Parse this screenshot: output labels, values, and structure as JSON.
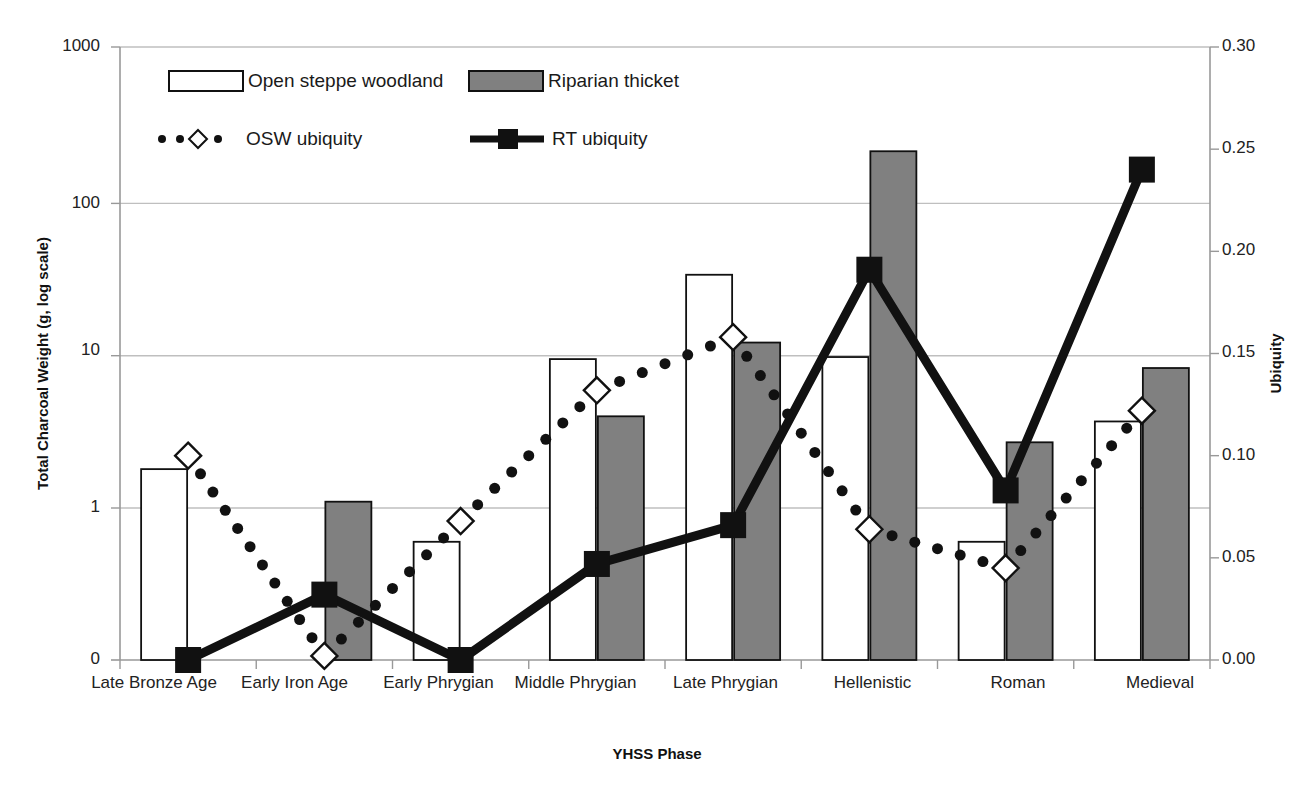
{
  "chart_data": {
    "type": "bar",
    "title": "",
    "xlabel": "YHSS Phase",
    "ylabel": "Total Charcoal Weight (g, log scale)",
    "y2label": "Ubiquity",
    "grid": true,
    "legend_position": "top-left inside plot",
    "categories": [
      "Late Bronze Age",
      "Early Iron Age",
      "Early Phrygian",
      "Middle Phrygian",
      "Late Phrygian",
      "Hellenistic",
      "Roman",
      "Medieval"
    ],
    "yscale": "log",
    "ylim": [
      0.1,
      1000
    ],
    "yticks": [
      "1000",
      "100",
      "10",
      "1",
      "0"
    ],
    "ytick_values": [
      1000,
      100,
      10,
      1,
      0
    ],
    "y2lim": [
      0.0,
      0.3
    ],
    "y2ticks": [
      "0.30",
      "0.25",
      "0.20",
      "0.15",
      "0.10",
      "0.05",
      "0.00"
    ],
    "y2tick_values": [
      0.3,
      0.25,
      0.2,
      0.15,
      0.1,
      0.05,
      0.0
    ],
    "series": [
      {
        "name": "Open steppe woodland",
        "kind": "bar",
        "axis": "left",
        "fill": "#ffffff",
        "stroke": "#111111",
        "values": [
          1.8,
          0,
          0.6,
          9.5,
          34,
          9.8,
          0.6,
          3.7
        ]
      },
      {
        "name": "Riparian thicket",
        "kind": "bar",
        "axis": "left",
        "fill": "#808080",
        "stroke": "#111111",
        "values": [
          0,
          1.1,
          0,
          4.0,
          12.2,
          220,
          2.7,
          8.3
        ]
      },
      {
        "name": "OSW ubiquity",
        "kind": "line",
        "axis": "right",
        "style": "dotted",
        "marker": "diamond-open",
        "stroke": "#111111",
        "values": [
          0.1,
          0.002,
          0.068,
          0.132,
          0.158,
          0.064,
          0.045,
          0.122
        ]
      },
      {
        "name": "RT ubiquity",
        "kind": "line",
        "axis": "right",
        "style": "solid-thick",
        "marker": "square-filled",
        "stroke": "#111111",
        "values": [
          0.0,
          0.032,
          0.0,
          0.047,
          0.066,
          0.191,
          0.083,
          0.24
        ]
      }
    ]
  },
  "legend": {
    "items": [
      {
        "label": "Open steppe woodland",
        "glyph": "white-bar-swatch"
      },
      {
        "label": "Riparian thicket",
        "glyph": "gray-bar-swatch"
      },
      {
        "label": "OSW ubiquity",
        "glyph": "dotted-line-diamond-marker"
      },
      {
        "label": "RT ubiquity",
        "glyph": "thick-line-square-marker"
      }
    ]
  },
  "axes": {
    "left_title": "Total Charcoal Weight (g, log scale)",
    "right_title": "Ubiquity",
    "x_title": "YHSS Phase"
  },
  "colors": {
    "bar_open": "#ffffff",
    "bar_riparian": "#808080",
    "line": "#111111",
    "gridline": "#bfbfbf",
    "axis": "#999999"
  }
}
